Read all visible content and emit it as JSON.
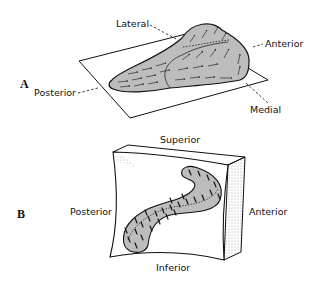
{
  "panels": [
    {
      "letter": "A",
      "labels": {
        "lateral": "Lateral",
        "anterior": "Anterior",
        "posterior": "Posterior",
        "medial": "Medial"
      }
    },
    {
      "letter": "B",
      "labels": {
        "superior": "Superior",
        "posterior": "Posterior",
        "anterior": "Anterior",
        "inferior": "Inferior"
      }
    }
  ],
  "colors": {
    "fill": "#bdbdbd",
    "stroke": "#1a1a1a",
    "stipple": "#9a9a9a"
  }
}
